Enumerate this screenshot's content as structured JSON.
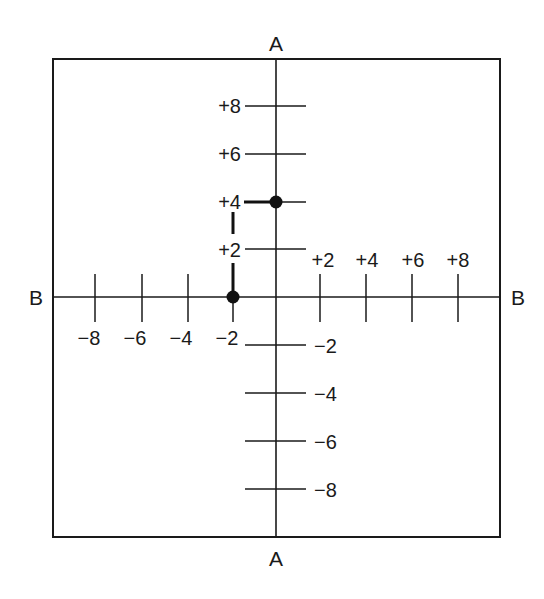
{
  "diagram": {
    "type": "coordinate-plane",
    "axis_labels": {
      "vertical_top": "A",
      "vertical_bottom": "A",
      "horizontal_left": "B",
      "horizontal_right": "B"
    },
    "vertical_axis_ticks": [
      {
        "value": 8,
        "label": "+8"
      },
      {
        "value": 6,
        "label": "+6"
      },
      {
        "value": 4,
        "label": "+4"
      },
      {
        "value": 2,
        "label": "+2"
      },
      {
        "value": -2,
        "label": "−2"
      },
      {
        "value": -4,
        "label": "−4"
      },
      {
        "value": -6,
        "label": "−6"
      },
      {
        "value": -8,
        "label": "−8"
      }
    ],
    "horizontal_axis_ticks": [
      {
        "value": -8,
        "label": "−8"
      },
      {
        "value": -6,
        "label": "−6"
      },
      {
        "value": -4,
        "label": "−4"
      },
      {
        "value": -2,
        "label": "−2"
      },
      {
        "value": 2,
        "label": "+2"
      },
      {
        "value": 4,
        "label": "+4"
      },
      {
        "value": 6,
        "label": "+6"
      },
      {
        "value": 8,
        "label": "+8"
      }
    ],
    "points": [
      {
        "name": "point-1",
        "b": -2,
        "a": 0
      },
      {
        "name": "point-2",
        "b": 0,
        "a": 4
      }
    ],
    "colors": {
      "line": "#1a1a1a",
      "background": "#ffffff"
    }
  }
}
